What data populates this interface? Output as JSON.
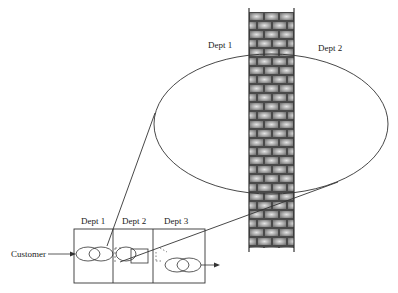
{
  "diagram": {
    "wall_labels": {
      "left": "Dept 1",
      "right": "Dept 2"
    },
    "process_box": {
      "departments": [
        "Dept 1",
        "Dept 2",
        "Dept 3"
      ],
      "input_label": "Customer"
    },
    "colors": {
      "line": "#333333",
      "brick_dark": "#555555",
      "brick_light": "#d8d8d8",
      "background": "#ffffff"
    }
  }
}
